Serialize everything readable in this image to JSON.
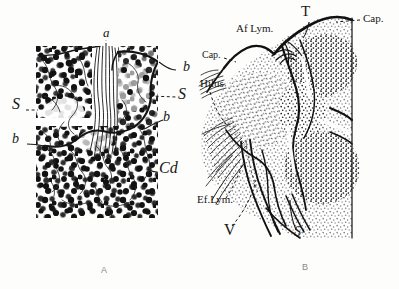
{
  "figure": {
    "title_present": false,
    "background_color": "#fdfdfb",
    "ink_color": "#171717",
    "style": "engraved line drawing, stippled histology plate",
    "panels": [
      {
        "id": "A",
        "caption": "A",
        "caption_color": "#8a8a8a",
        "description": "Lymph node cortex detail, dense cell stippling with reticular fibers and a central trabecular strand",
        "labels": [
          {
            "key": "a",
            "text": "a",
            "x": 103,
            "y": 33,
            "size": 13,
            "italic": true
          },
          {
            "key": "b1",
            "text": "b",
            "x": 183,
            "y": 68,
            "size": 14,
            "italic": true
          },
          {
            "key": "S1",
            "text": "S",
            "x": 178,
            "y": 96,
            "size": 16,
            "italic": true
          },
          {
            "key": "b2",
            "text": "b",
            "x": 163,
            "y": 117,
            "size": 14,
            "italic": true
          },
          {
            "key": "S2",
            "text": "S",
            "x": 12,
            "y": 105,
            "size": 16,
            "italic": true
          },
          {
            "key": "b3",
            "text": "b",
            "x": 12,
            "y": 140,
            "size": 14,
            "italic": true
          },
          {
            "key": "Cd",
            "text": "Cd",
            "x": 159,
            "y": 170,
            "size": 16,
            "italic": true
          }
        ]
      },
      {
        "id": "B",
        "caption": "B",
        "caption_color": "#8a8a8a",
        "description": "Whole lymph node section showing capsule, afferent and efferent lymphatics, hilus, vein and sinus",
        "labels": [
          {
            "key": "T",
            "text": "T",
            "x": 301,
            "y": 8,
            "size": 15,
            "italic": false
          },
          {
            "key": "CapR",
            "text": "Cap.",
            "x": 363,
            "y": 16,
            "size": 11,
            "italic": false
          },
          {
            "key": "AfLym",
            "text": "Af Lym.",
            "x": 236,
            "y": 28,
            "size": 11,
            "italic": false
          },
          {
            "key": "CapL",
            "text": "Cap.",
            "x": 202,
            "y": 53,
            "size": 10,
            "italic": false
          },
          {
            "key": "Hilus",
            "text": "Hilus",
            "x": 200,
            "y": 83,
            "size": 11,
            "italic": false
          },
          {
            "key": "EfLym",
            "text": "Ef.Lym.",
            "x": 197,
            "y": 198,
            "size": 11,
            "italic": false
          },
          {
            "key": "V",
            "text": "V",
            "x": 224,
            "y": 230,
            "size": 16,
            "italic": false
          },
          {
            "key": "S",
            "text": "S",
            "x": 294,
            "y": 233,
            "size": 14,
            "italic": true
          }
        ]
      }
    ],
    "panel_captions": [
      {
        "text": "A",
        "x": 101,
        "y": 266
      },
      {
        "text": "B",
        "x": 302,
        "y": 263
      }
    ]
  }
}
